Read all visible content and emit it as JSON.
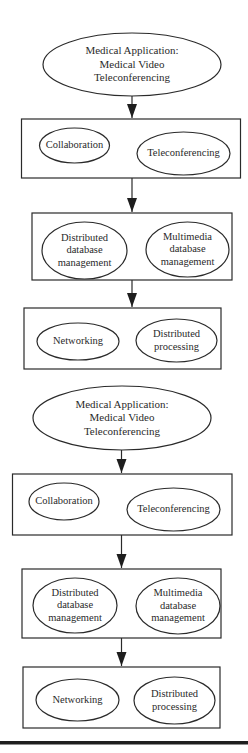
{
  "colors": {
    "stroke": "#2a2a2a",
    "text": "#2a2a2a",
    "background": "#ffffff",
    "footer_bar": "#1e1e1e"
  },
  "diagrams": [
    {
      "root": {
        "label": "Medical Application:\nMedical Video\nTeleconferencing",
        "lines": [
          "Medical Application:",
          "Medical Video",
          "Teleconferencing"
        ]
      },
      "layers": [
        {
          "items": [
            {
              "label": "Collaboration"
            },
            {
              "label": "Teleconferencing"
            }
          ]
        },
        {
          "items": [
            {
              "label": "Distributed\ndatabase\nmanagement"
            },
            {
              "label": "Multimedia\ndatabase\nmanagement"
            }
          ]
        },
        {
          "items": [
            {
              "label": "Networking"
            },
            {
              "label": "Distributed\nprocessing"
            }
          ]
        }
      ]
    },
    {
      "root": {
        "label": "Medical Application:\nMedical Video\nTeleconferencing",
        "lines": [
          "Medical Application:",
          "Medical Video",
          "Teleconferencing"
        ]
      },
      "layers": [
        {
          "items": [
            {
              "label": "Collaboration"
            },
            {
              "label": "Teleconferencing"
            }
          ]
        },
        {
          "items": [
            {
              "label": "Distributed\ndatabase\nmanagement"
            },
            {
              "label": "Multimedia\ndatabase\nmanagement"
            }
          ]
        },
        {
          "items": [
            {
              "label": "Networking"
            },
            {
              "label": "Distributed\nprocessing"
            }
          ]
        }
      ]
    }
  ]
}
